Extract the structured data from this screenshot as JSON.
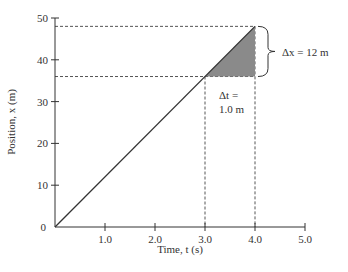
{
  "chart_data": {
    "type": "line",
    "title": "",
    "xlabel": "Time, t (s)",
    "ylabel": "Position, x (m)",
    "xlim": [
      0,
      5.0
    ],
    "ylim": [
      0,
      50
    ],
    "x_ticks": [
      "1.0",
      "2.0",
      "3.0",
      "4.0",
      "5.0"
    ],
    "y_ticks": [
      "0",
      "10",
      "20",
      "30",
      "40",
      "50"
    ],
    "grid": false,
    "series": [
      {
        "name": "position",
        "x": [
          0,
          4.0
        ],
        "y": [
          0,
          48
        ]
      }
    ],
    "annotations": {
      "shaded_triangle": {
        "t_start": 3.0,
        "t_end": 4.0,
        "x_start": 36,
        "x_end": 48
      },
      "dashed_lines": {
        "horizontal_y": [
          36,
          48
        ],
        "vertical_x": [
          3.0,
          4.0
        ]
      },
      "delta_x_label": "Δx = 12 m",
      "delta_t_label_line1": "Δt =",
      "delta_t_label_line2": "1.0 m"
    }
  },
  "colors": {
    "line": "#333333",
    "shade": "#8a8a8a",
    "dash": "#555555"
  }
}
